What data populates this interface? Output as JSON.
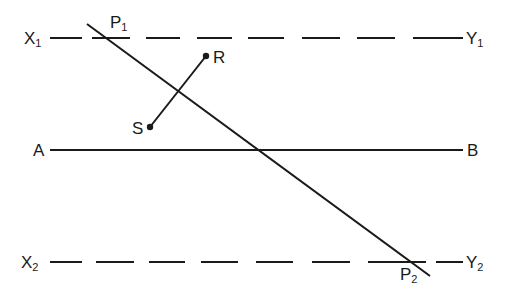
{
  "figure": {
    "lines": {
      "x1y1": {
        "start": "X",
        "start_sub": "1",
        "end": "Y",
        "end_sub": "1",
        "style": "dashed"
      },
      "ab": {
        "start": "A",
        "end": "B",
        "style": "solid"
      },
      "x2y2": {
        "start": "X",
        "start_sub": "2",
        "end": "Y",
        "end_sub": "2",
        "style": "dashed"
      },
      "p1p2": {
        "start": "P",
        "start_sub": "1",
        "end": "P",
        "end_sub": "2",
        "style": "solid"
      },
      "sr": {
        "start": "S",
        "end": "R",
        "style": "solid"
      }
    },
    "labels": {
      "x1": "X",
      "x1_sub": "1",
      "y1": "Y",
      "y1_sub": "1",
      "p1": "P",
      "p1_sub": "1",
      "r": "R",
      "s": "S",
      "a": "A",
      "b": "B",
      "x2": "X",
      "x2_sub": "2",
      "y2": "Y",
      "y2_sub": "2",
      "p2": "P",
      "p2_sub": "2"
    },
    "colors": {
      "ink": "#1a1a1a",
      "background": "#ffffff"
    }
  }
}
